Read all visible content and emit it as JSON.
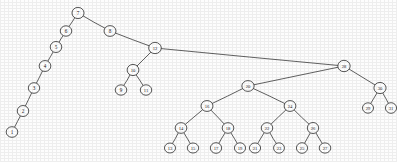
{
  "figure": {
    "kind": "binary-search-tree-diagram",
    "node_count": 31,
    "ink_color": "#2e2e2e",
    "node_fill": "#ffffff",
    "background": "#fdfdfd"
  },
  "chart_data": {
    "type": "diagram",
    "title": "",
    "root": "7",
    "nodes": [
      {
        "id": "7",
        "label": "7",
        "x": 78,
        "y": 13,
        "r": 6.0
      },
      {
        "id": "6",
        "label": "6",
        "x": 66,
        "y": 31,
        "r": 5.8
      },
      {
        "id": "5",
        "label": "5",
        "x": 56,
        "y": 47,
        "r": 5.8
      },
      {
        "id": "4",
        "label": "4",
        "x": 45,
        "y": 66,
        "r": 5.8
      },
      {
        "id": "3",
        "label": "3",
        "x": 34,
        "y": 88,
        "r": 5.8
      },
      {
        "id": "2",
        "label": "2",
        "x": 23,
        "y": 111,
        "r": 5.8
      },
      {
        "id": "1",
        "label": "1",
        "x": 12,
        "y": 132,
        "r": 5.8
      },
      {
        "id": "8",
        "label": "8",
        "x": 110,
        "y": 31,
        "r": 5.8
      },
      {
        "id": "12",
        "label": "12",
        "x": 155,
        "y": 48,
        "r": 6.2
      },
      {
        "id": "10",
        "label": "10",
        "x": 133,
        "y": 70,
        "r": 6.0
      },
      {
        "id": "9",
        "label": "9",
        "x": 121,
        "y": 90,
        "r": 5.6
      },
      {
        "id": "11",
        "label": "11",
        "x": 146,
        "y": 90,
        "r": 5.6
      },
      {
        "id": "28",
        "label": "28",
        "x": 344,
        "y": 66,
        "r": 6.2
      },
      {
        "id": "20",
        "label": "20",
        "x": 248,
        "y": 86,
        "r": 6.0
      },
      {
        "id": "16",
        "label": "16",
        "x": 207,
        "y": 106,
        "r": 6.0
      },
      {
        "id": "14",
        "label": "14",
        "x": 181,
        "y": 128,
        "r": 5.8
      },
      {
        "id": "13",
        "label": "13",
        "x": 170,
        "y": 148,
        "r": 5.6
      },
      {
        "id": "15",
        "label": "15",
        "x": 193,
        "y": 148,
        "r": 5.6
      },
      {
        "id": "18",
        "label": "18",
        "x": 228,
        "y": 128,
        "r": 5.8
      },
      {
        "id": "17",
        "label": "17",
        "x": 216,
        "y": 148,
        "r": 5.6
      },
      {
        "id": "19",
        "label": "19",
        "x": 240,
        "y": 148,
        "r": 5.6
      },
      {
        "id": "24",
        "label": "24",
        "x": 290,
        "y": 106,
        "r": 6.0
      },
      {
        "id": "22",
        "label": "22",
        "x": 267,
        "y": 128,
        "r": 5.8
      },
      {
        "id": "21",
        "label": "21",
        "x": 255,
        "y": 148,
        "r": 5.6
      },
      {
        "id": "23",
        "label": "23",
        "x": 279,
        "y": 148,
        "r": 5.6
      },
      {
        "id": "26",
        "label": "26",
        "x": 313,
        "y": 128,
        "r": 5.8
      },
      {
        "id": "25",
        "label": "25",
        "x": 302,
        "y": 148,
        "r": 5.6
      },
      {
        "id": "27",
        "label": "27",
        "x": 325,
        "y": 148,
        "r": 5.6
      },
      {
        "id": "30",
        "label": "30",
        "x": 380,
        "y": 88,
        "r": 6.0
      },
      {
        "id": "29",
        "label": "29",
        "x": 368,
        "y": 108,
        "r": 5.6
      },
      {
        "id": "31",
        "label": "31",
        "x": 391,
        "y": 108,
        "r": 5.6
      }
    ],
    "edges": [
      {
        "from": "7",
        "to": "6"
      },
      {
        "from": "6",
        "to": "5"
      },
      {
        "from": "5",
        "to": "4"
      },
      {
        "from": "4",
        "to": "3"
      },
      {
        "from": "3",
        "to": "2"
      },
      {
        "from": "2",
        "to": "1"
      },
      {
        "from": "7",
        "to": "8"
      },
      {
        "from": "8",
        "to": "12"
      },
      {
        "from": "12",
        "to": "10"
      },
      {
        "from": "10",
        "to": "9"
      },
      {
        "from": "10",
        "to": "11"
      },
      {
        "from": "12",
        "to": "28"
      },
      {
        "from": "28",
        "to": "20"
      },
      {
        "from": "20",
        "to": "16"
      },
      {
        "from": "16",
        "to": "14"
      },
      {
        "from": "14",
        "to": "13"
      },
      {
        "from": "14",
        "to": "15"
      },
      {
        "from": "16",
        "to": "18"
      },
      {
        "from": "18",
        "to": "17"
      },
      {
        "from": "18",
        "to": "19"
      },
      {
        "from": "20",
        "to": "24"
      },
      {
        "from": "24",
        "to": "22"
      },
      {
        "from": "22",
        "to": "21"
      },
      {
        "from": "22",
        "to": "23"
      },
      {
        "from": "24",
        "to": "26"
      },
      {
        "from": "26",
        "to": "25"
      },
      {
        "from": "26",
        "to": "27"
      },
      {
        "from": "28",
        "to": "30"
      },
      {
        "from": "30",
        "to": "29"
      },
      {
        "from": "30",
        "to": "31"
      }
    ]
  }
}
